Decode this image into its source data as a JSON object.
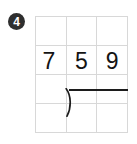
{
  "problem": {
    "step_badge": {
      "label": "4",
      "shape": "filled-circle",
      "fill_color": "#2e2e2e",
      "text_color": "#ffffff"
    },
    "grid": {
      "columns": 3,
      "rows": 4,
      "line_color": "#d8d8d8",
      "cells": [
        [
          "",
          "",
          ""
        ],
        [
          "7",
          "5",
          "9"
        ],
        [
          "",
          "",
          ""
        ],
        [
          "",
          "",
          ""
        ]
      ]
    },
    "long_division": {
      "divisor": "7",
      "dividend_digits": [
        "5",
        "9"
      ],
      "dividend": "59",
      "quotient": "",
      "bracket_symbol": "long-division-bracket",
      "ink_color": "#141414"
    }
  }
}
